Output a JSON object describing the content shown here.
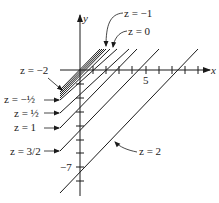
{
  "diagram": {
    "type": "level-curves",
    "axes": {
      "x_label": "x",
      "y_label": "y",
      "x_tick_label": "5",
      "y_tick_label": "−7"
    },
    "level_curves": [
      {
        "label": "z = −2",
        "value": -2
      },
      {
        "label": "z = −1",
        "value": -1
      },
      {
        "label": "z = 0",
        "value": 0
      },
      {
        "label": "z = −½",
        "value": -0.5
      },
      {
        "label": "z = ½",
        "value": 0.5
      },
      {
        "label": "z = 1",
        "value": 1
      },
      {
        "label": "z = 3/2",
        "value": 1.5
      },
      {
        "label": "z = 2",
        "value": 2
      }
    ],
    "line_color": "#1a1a1a"
  }
}
